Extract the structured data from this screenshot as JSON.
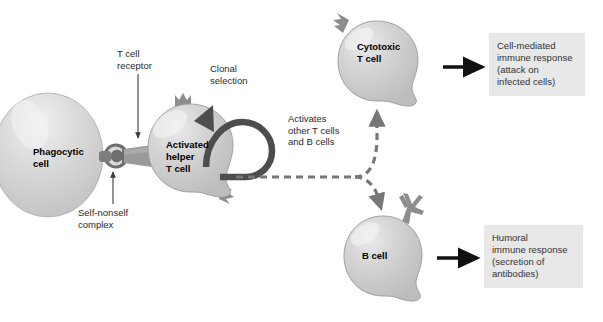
{
  "diagram": {
    "background_color": "#ffffff",
    "cell_fill_color": "#c9c9c9",
    "cell_stroke_color": "#8f8f8f",
    "receptor_color": "#8a8a8a",
    "complex_color": "#6e6e6e",
    "arrow_color": "#111111",
    "dashed_arrow_color": "#777777",
    "loop_arrow_color": "#4d4d4d",
    "response_box_color": "#e8e8e8"
  },
  "cells": {
    "phagocytic": {
      "label": "Phagocytic\ncell",
      "name": "phagocytic-cell"
    },
    "helper": {
      "label": "Activated\nhelper\nT cell",
      "name": "activated-helper-t-cell"
    },
    "cytotoxic": {
      "label": "Cytotoxic\nT cell",
      "name": "cytotoxic-t-cell"
    },
    "bcell": {
      "label": "B cell",
      "name": "b-cell"
    }
  },
  "annotations": {
    "t_cell_receptor": "T cell\nreceptor",
    "self_nonself_complex": "Self-nonself\ncomplex",
    "clonal_selection": "Clonal\nselection",
    "activates_others": "Activates\nother T cells\nand B cells"
  },
  "responses": {
    "cell_mediated": "Cell-mediated\nimmune response\n(attack on\ninfected cells)",
    "humoral": "Humoral\nimmune response\n(secretion of\nantibodies)"
  }
}
